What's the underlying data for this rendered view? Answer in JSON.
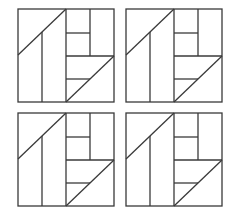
{
  "figure": {
    "stroke_color": "#3a3a3a",
    "background": "#ffffff",
    "blocks": [
      {
        "id": "block-top-left",
        "x": 18,
        "y": 9
      },
      {
        "id": "block-top-right",
        "x": 126,
        "y": 9
      },
      {
        "id": "block-bottom-left",
        "x": 18,
        "y": 113
      },
      {
        "id": "block-bottom-right",
        "x": 126,
        "y": 113
      }
    ],
    "block_size": {
      "width": 96,
      "height": 93
    }
  }
}
